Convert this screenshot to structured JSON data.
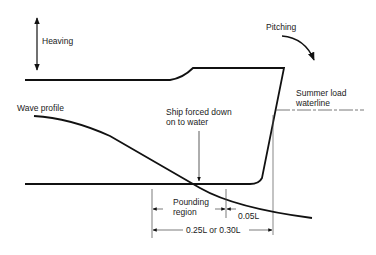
{
  "diagram": {
    "labels": {
      "heaving": "Heaving",
      "pitching": "Pitching",
      "summer_load_line1": "Summer load",
      "summer_load_line2": "waterline",
      "wave_profile": "Wave profile",
      "ship_forced_line1": "Ship forced down",
      "ship_forced_line2": "on to water",
      "pounding_line1": "Pounding",
      "pounding_line2": "region",
      "dim_005": "0.05L",
      "dim_025": "0.25L or 0.30L"
    },
    "colors": {
      "line": "#111111",
      "thin": "#555555",
      "background": "#ffffff"
    }
  }
}
